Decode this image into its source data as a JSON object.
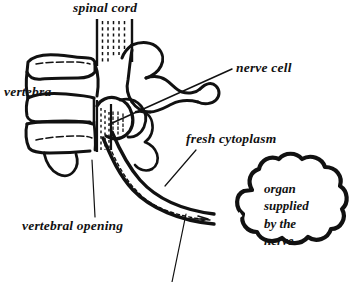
{
  "figure": {
    "style": "black-and-white line art",
    "background_color": "#ffffff",
    "ink_color": "#111111"
  },
  "labels": {
    "spinal_cord": "spinal cord",
    "vertebra": "vertebra",
    "nerve_cell": "nerve cell",
    "fresh_cytoplasm": "fresh cytoplasm",
    "vertebral_opening": "vertebral opening",
    "organ_line_1": "organ",
    "organ_line_2": "supplied",
    "organ_line_3": "by the",
    "organ_line_4": "nerve"
  },
  "parts": {
    "spinal_cord_icon": "spinal-cord-hatched-column",
    "vertebra_icon": "vertebra-outline",
    "nerve_icon": "nerve-axon-curve",
    "organ_icon": "cloud-shape",
    "arrow_icon": "flow-arrow"
  }
}
